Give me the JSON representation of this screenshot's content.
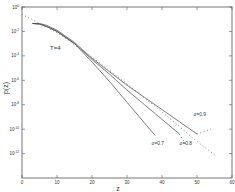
{
  "chart_data": {
    "type": "line",
    "title": "",
    "xlabel": "z",
    "ylabel": "p(z)",
    "xlim": [
      0,
      60
    ],
    "ylim_log10": [
      -14,
      0
    ],
    "yscale": "log",
    "grid": false,
    "x_ticks": [
      "0",
      "10",
      "20",
      "30",
      "40",
      "50",
      "60"
    ],
    "y_ticks": [
      {
        "exp": 0,
        "label": "10^0"
      },
      {
        "exp": -2,
        "label": "10^-2"
      },
      {
        "exp": -4,
        "label": "10^-4"
      },
      {
        "exp": -6,
        "label": "10^-6"
      },
      {
        "exp": -8,
        "label": "10^-8"
      },
      {
        "exp": -10,
        "label": "10^-10"
      },
      {
        "exp": -12,
        "label": "10^-12"
      }
    ],
    "annotations": [
      {
        "text": "T=4",
        "x": 8,
        "y_log10": -3.5
      },
      {
        "text": "σ=0.7",
        "x": 37,
        "y_log10": -11.3
      },
      {
        "text": "σ=0.8",
        "x": 45,
        "y_log10": -11.3
      },
      {
        "text": "σ=0.9",
        "x": 49,
        "y_log10": -8.9
      }
    ],
    "series": [
      {
        "name": "σ=0.7",
        "style": "solid",
        "x": [
          3,
          5,
          7,
          10,
          15,
          20,
          25,
          30,
          35,
          38
        ],
        "y_log10": [
          -1.35,
          -1.4,
          -1.6,
          -2.0,
          -3.0,
          -4.5,
          -6.1,
          -7.8,
          -9.5,
          -10.5
        ]
      },
      {
        "name": "σ=0.8",
        "style": "solid",
        "x": [
          3,
          5,
          7,
          10,
          15,
          20,
          25,
          30,
          35,
          40,
          45
        ],
        "y_log10": [
          -1.35,
          -1.4,
          -1.6,
          -2.0,
          -3.0,
          -4.3,
          -5.5,
          -6.8,
          -8.0,
          -9.2,
          -10.4
        ]
      },
      {
        "name": "σ=0.9",
        "style": "solid",
        "x": [
          3,
          5,
          7,
          10,
          15,
          20,
          25,
          30,
          35,
          40,
          45,
          50
        ],
        "y_log10": [
          -1.35,
          -1.35,
          -1.5,
          -1.9,
          -2.9,
          -4.2,
          -5.3,
          -6.4,
          -7.4,
          -8.4,
          -9.4,
          -10.4
        ]
      },
      {
        "name": "reference",
        "style": "dotted",
        "x": [
          0,
          10,
          20,
          30,
          40,
          50,
          55
        ],
        "y_log10": [
          -0.6,
          -2.1,
          -4.1,
          -6.3,
          -8.6,
          -11.0,
          -12.1
        ]
      },
      {
        "name": "σ=0.9 tail",
        "style": "dotted",
        "x": [
          50,
          52,
          54
        ],
        "y_log10": [
          -10.4,
          -10.2,
          -10.0
        ]
      },
      {
        "name": "σ=0.8 tail",
        "style": "dotted",
        "x": [
          45,
          46,
          47
        ],
        "y_log10": [
          -10.4,
          -10.9,
          -11.3
        ]
      }
    ]
  }
}
